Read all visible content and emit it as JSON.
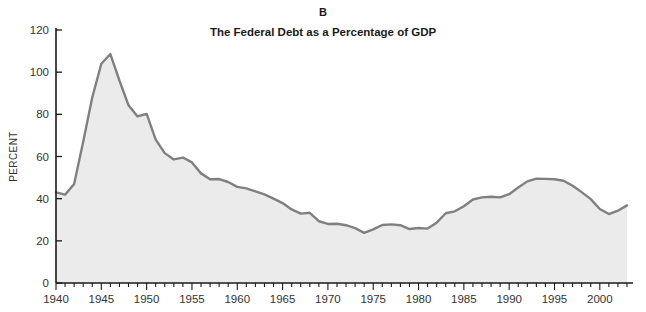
{
  "panel": {
    "letter": "B",
    "title": "The Federal Debt as a Percentage of GDP"
  },
  "colors": {
    "line": "#808080",
    "fill": "#ebebeb",
    "axis": "#1a1a1a",
    "text": "#1a1a1a",
    "background": "#ffffff"
  },
  "chart_data": {
    "type": "area",
    "title": "The Federal Debt as a Percentage of GDP",
    "subtitle": "B",
    "xlabel": "",
    "ylabel": "PERCENT",
    "xlim": [
      1940,
      2003
    ],
    "ylim": [
      0,
      120
    ],
    "yticks": [
      0,
      20,
      40,
      60,
      80,
      100,
      120
    ],
    "ytick_labels": [
      "0",
      "20",
      "40",
      "60",
      "80",
      "100",
      "120"
    ],
    "xticks": [
      1940,
      1945,
      1950,
      1955,
      1960,
      1965,
      1970,
      1975,
      1980,
      1985,
      1990,
      1995,
      2000
    ],
    "xtick_labels": [
      "1940",
      "1945",
      "1950",
      "1955",
      "1960",
      "1965",
      "1970",
      "1975",
      "1980",
      "1985",
      "1990",
      "1995",
      "2000"
    ],
    "minor_xticks_every": 1,
    "grid": false,
    "legend": null,
    "x": [
      1940,
      1941,
      1942,
      1943,
      1944,
      1945,
      1946,
      1947,
      1948,
      1949,
      1950,
      1951,
      1952,
      1953,
      1954,
      1955,
      1956,
      1957,
      1958,
      1959,
      1960,
      1961,
      1962,
      1963,
      1964,
      1965,
      1966,
      1967,
      1968,
      1969,
      1970,
      1971,
      1972,
      1973,
      1974,
      1975,
      1976,
      1977,
      1978,
      1979,
      1980,
      1981,
      1982,
      1983,
      1984,
      1985,
      1986,
      1987,
      1988,
      1989,
      1990,
      1991,
      1992,
      1993,
      1994,
      1995,
      1996,
      1997,
      1998,
      1999,
      2000,
      2001,
      2002,
      2003
    ],
    "values": [
      43.0,
      41.9,
      47.0,
      67.0,
      88.0,
      104.0,
      108.6,
      96.0,
      84.3,
      79.0,
      80.2,
      68.0,
      61.6,
      58.6,
      59.5,
      57.2,
      52.0,
      49.2,
      49.3,
      47.9,
      45.6,
      44.9,
      43.5,
      42.0,
      40.0,
      37.9,
      34.9,
      32.9,
      33.3,
      29.3,
      28.0,
      28.1,
      27.4,
      26.0,
      23.8,
      25.4,
      27.5,
      27.8,
      27.4,
      25.6,
      26.1,
      25.8,
      28.6,
      33.1,
      34.0,
      36.4,
      39.6,
      40.6,
      40.9,
      40.6,
      42.1,
      45.3,
      48.2,
      49.5,
      49.4,
      49.2,
      48.5,
      46.1,
      43.1,
      39.8,
      35.1,
      32.7,
      34.3,
      36.8
    ]
  }
}
